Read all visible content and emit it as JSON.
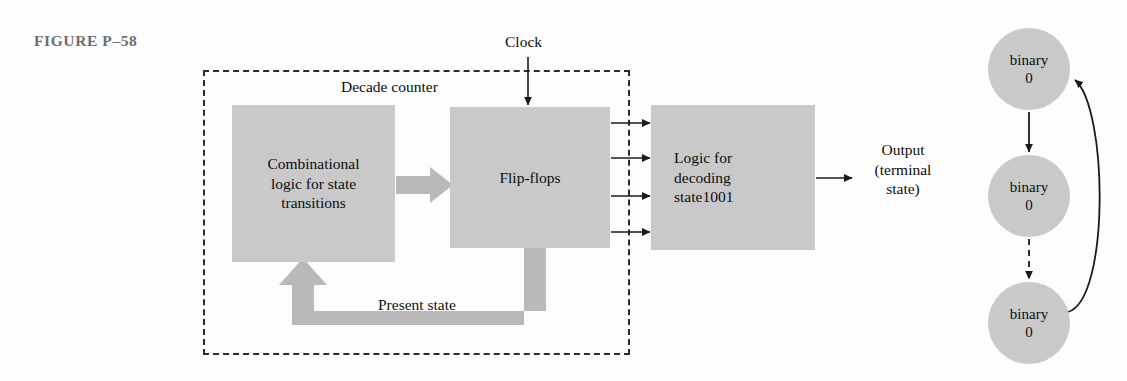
{
  "figure": {
    "label": "FIGURE P–58"
  },
  "enclosure": {
    "title": "Decade counter"
  },
  "signals": {
    "clock": "Clock",
    "present_state": "Present state",
    "output_line_1": "Output",
    "output_line_2": "(terminal",
    "output_line_3": "state)"
  },
  "blocks": [
    {
      "name": "combinational-logic",
      "line_1": "Combinational",
      "line_2": "logic for state",
      "line_3": "transitions"
    },
    {
      "name": "flip-flops",
      "line_1": "Flip-flops"
    },
    {
      "name": "decoding-logic",
      "line_1": "Logic for",
      "line_2": "decoding",
      "line_3": "state1001"
    }
  ],
  "state_diagram": {
    "states": [
      {
        "line_1": "binary",
        "line_2": "0"
      },
      {
        "line_1": "binary",
        "line_2": "0"
      },
      {
        "line_1": "binary",
        "line_2": "0"
      }
    ]
  },
  "colors": {
    "block_fill": "#c9c9c9",
    "arrow_gray": "#b4b4b4",
    "stroke": "#1a1a1a",
    "caption": "#6e6e6e"
  }
}
